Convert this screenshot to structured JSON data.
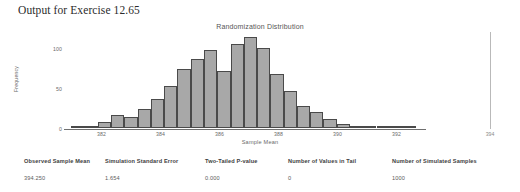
{
  "heading": "Output for Exercise 12.65",
  "chart": {
    "title": "Randomization Distribution",
    "xlabel": "Sample Mean",
    "ylabel": "Frequency",
    "observed_marker_label": "394"
  },
  "table": {
    "headers": [
      "Observed Sample Mean",
      "Simulation Standard Error",
      "Two-Tailed P-value",
      "Number of Values in Tail",
      "Number of Simulated Samples"
    ],
    "values": [
      "394.250",
      "1.654",
      "0.000",
      "0",
      "1000"
    ]
  },
  "chart_data": {
    "type": "bar",
    "title": "Randomization Distribution",
    "xlabel": "Sample Mean",
    "ylabel": "Frequency",
    "xlim": [
      381.0,
      392.8
    ],
    "ylim": [
      0,
      120
    ],
    "xticks": [
      382,
      384,
      386,
      388,
      390,
      392
    ],
    "yticks": [
      0,
      50,
      100
    ],
    "grid": false,
    "legend": false,
    "bin_width": 0.45,
    "bin_centers": [
      381.2,
      381.65,
      382.1,
      382.55,
      383.0,
      383.45,
      383.9,
      384.35,
      384.8,
      385.25,
      385.7,
      386.15,
      386.6,
      387.05,
      387.5,
      387.95,
      388.4,
      388.85,
      389.3,
      389.75,
      390.2,
      390.65,
      391.1,
      391.55,
      392.0,
      392.45
    ],
    "values": [
      2,
      3,
      8,
      17,
      14,
      24,
      37,
      53,
      74,
      86,
      98,
      72,
      105,
      114,
      100,
      68,
      47,
      28,
      20,
      12,
      5,
      2,
      2,
      1,
      1,
      1
    ],
    "annotations": [
      {
        "type": "vertical-line",
        "x": 394.25,
        "label": "394",
        "note": "observed sample mean marker"
      }
    ]
  }
}
